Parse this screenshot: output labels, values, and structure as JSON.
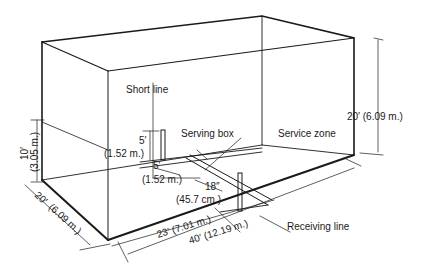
{
  "diagram": {
    "labels": {
      "short_line": "Short line",
      "serving_box": "Serving box",
      "service_zone": "Service zone",
      "receiving_line": "Receiving line",
      "height": "20′ (6.09 m.)",
      "back_wall_height_ft": "10′",
      "back_wall_height_m": "(3.05 m.)",
      "width_ft": "20′",
      "width_m": "(6.09 m.)",
      "serving_box_height_ft": "5′",
      "serving_box_height_m": "(1.52 m.)",
      "serving_box_width_ft": "5′",
      "serving_box_width_m": "(1.52 m.)",
      "gap_in": "18″",
      "gap_cm": "(45.7 cm.)",
      "receiving_distance": "23′ (7.01 m.)",
      "length": "40′ (12.19 m.)"
    },
    "colors": {
      "line": "#1a1a1a",
      "background": "#ffffff"
    }
  }
}
